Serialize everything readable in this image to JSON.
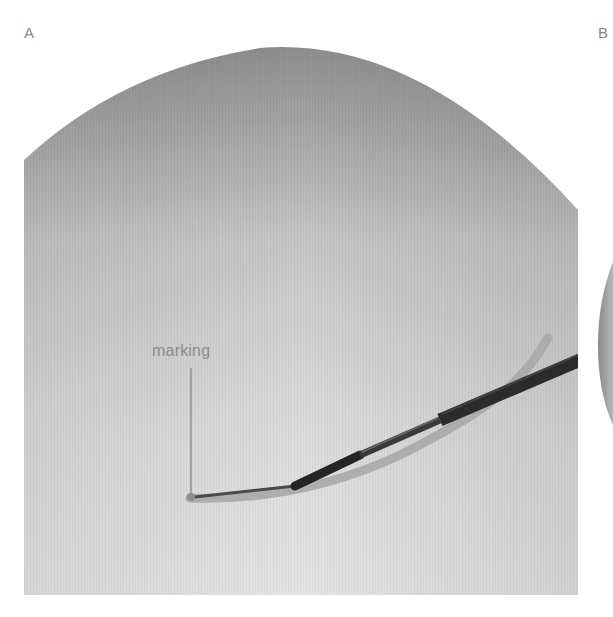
{
  "figure": {
    "panels": [
      {
        "id": "A",
        "label": "A",
        "annotation": {
          "text": "marking"
        },
        "content": "fluoroscopic-style grayscale image of a domed field with a dark needle and a lighter curved tube"
      },
      {
        "id": "B",
        "label": "B",
        "content": "partially visible grayscale circular field (cropped at right edge)"
      }
    ],
    "colors": {
      "background": "#ffffff",
      "field_top": "#8e8e8e",
      "field_bottom": "#e2e2e2",
      "needle": "#2a2a2a",
      "tube": "#a8a8a8",
      "label_text": "#8a8a8a",
      "leader_line": "#8c8c8c"
    }
  }
}
